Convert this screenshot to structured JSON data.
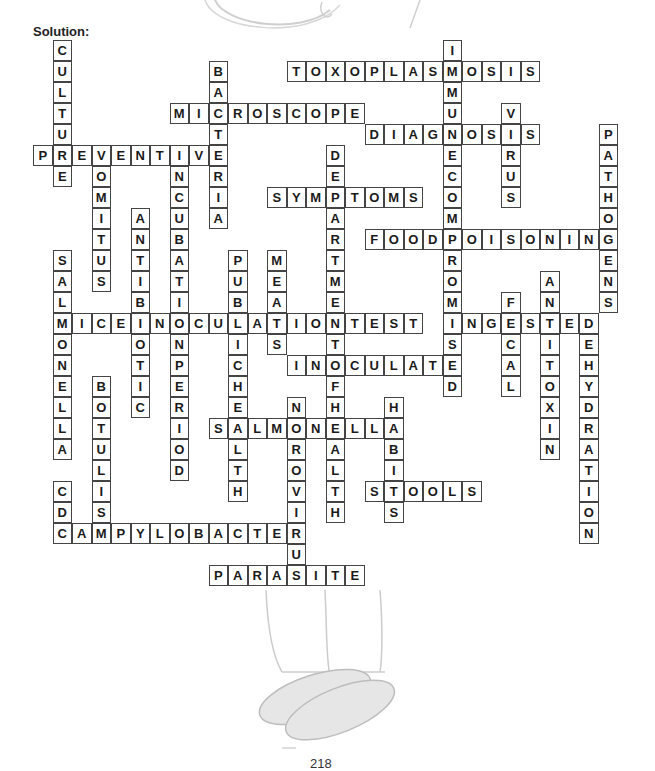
{
  "title": "Solution:",
  "page_number": "218",
  "grid": {
    "origin_x": 33,
    "origin_y": 40,
    "cell_w": 19.5,
    "cell_h": 21
  },
  "words": [
    {
      "word": "CULTURE",
      "dir": "down",
      "col": 1,
      "row": 0
    },
    {
      "word": "BACTERIA",
      "dir": "down",
      "col": 9,
      "row": 1
    },
    {
      "word": "TOXOPLASMOSIS",
      "dir": "across",
      "col": 13,
      "row": 1
    },
    {
      "word": "IMMUNECOMPROMISED",
      "dir": "down",
      "col": 21,
      "row": 0
    },
    {
      "word": "MICROSCOPE",
      "dir": "across",
      "col": 7,
      "row": 3
    },
    {
      "word": "VIRUS",
      "dir": "down",
      "col": 24,
      "row": 3
    },
    {
      "word": "DIAGNOSIS",
      "dir": "across",
      "col": 17,
      "row": 4
    },
    {
      "word": "PATHOGENS",
      "dir": "down",
      "col": 29,
      "row": 4
    },
    {
      "word": "PREVENTIVE",
      "dir": "across",
      "col": 0,
      "row": 5
    },
    {
      "word": "VOMITUS",
      "dir": "down",
      "col": 3,
      "row": 5
    },
    {
      "word": "INCUBATIONPERIOD",
      "dir": "down",
      "col": 7,
      "row": 5
    },
    {
      "word": "DEPARTMENTOFHEALTH",
      "dir": "down",
      "col": 15,
      "row": 5
    },
    {
      "word": "SYMPTOMS",
      "dir": "across",
      "col": 12,
      "row": 7
    },
    {
      "word": "ANTIBIOTIC",
      "dir": "down",
      "col": 5,
      "row": 8
    },
    {
      "word": "FOODPOISONING",
      "dir": "across",
      "col": 17,
      "row": 9
    },
    {
      "word": "SALMONELLA",
      "dir": "down",
      "col": 1,
      "row": 10
    },
    {
      "word": "PUBLICHEALTH",
      "dir": "down",
      "col": 10,
      "row": 10
    },
    {
      "word": "MEATS",
      "dir": "down",
      "col": 12,
      "row": 10
    },
    {
      "word": "ANTITOXIN",
      "dir": "down",
      "col": 26,
      "row": 11
    },
    {
      "word": "FECAL",
      "dir": "down",
      "col": 24,
      "row": 12
    },
    {
      "word": "MICEINOCULATIONTEST",
      "dir": "across",
      "col": 1,
      "row": 13
    },
    {
      "word": "INGESTED",
      "dir": "across",
      "col": 21,
      "row": 13
    },
    {
      "word": "DEHYDRATION",
      "dir": "down",
      "col": 28,
      "row": 13
    },
    {
      "word": "INOCULATE",
      "dir": "across",
      "col": 13,
      "row": 15
    },
    {
      "word": "BOTULISM",
      "dir": "down",
      "col": 3,
      "row": 16
    },
    {
      "word": "NOROVIRUS",
      "dir": "down",
      "col": 13,
      "row": 17
    },
    {
      "word": "HABITS",
      "dir": "down",
      "col": 18,
      "row": 17
    },
    {
      "word": "SALMONELLA",
      "dir": "across",
      "col": 9,
      "row": 18
    },
    {
      "word": "STOOLS",
      "dir": "across",
      "col": 17,
      "row": 21
    },
    {
      "word": "CDC",
      "dir": "down",
      "col": 1,
      "row": 21
    },
    {
      "word": "CAMPYLOBACTER",
      "dir": "across",
      "col": 1,
      "row": 23
    },
    {
      "word": "PARASITE",
      "dir": "across",
      "col": 9,
      "row": 25
    }
  ],
  "colors": {
    "border": "#444444",
    "letter": "#1a1a1a",
    "sketch": "#c8c8c8"
  }
}
